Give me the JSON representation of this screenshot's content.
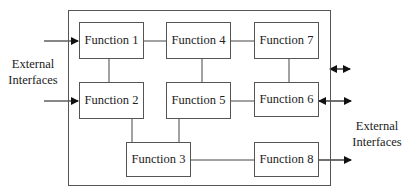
{
  "diagram": {
    "type": "functional-block-diagram",
    "frame_label": "",
    "functions": [
      {
        "id": "f1",
        "label": "Function 1"
      },
      {
        "id": "f2",
        "label": "Function 2"
      },
      {
        "id": "f3",
        "label": "Function 3"
      },
      {
        "id": "f4",
        "label": "Function 4"
      },
      {
        "id": "f5",
        "label": "Function 5"
      },
      {
        "id": "f6",
        "label": "Function 6"
      },
      {
        "id": "f7",
        "label": "Function 7"
      },
      {
        "id": "f8",
        "label": "Function 8"
      }
    ],
    "external_interfaces": {
      "left_label_line1": "External",
      "left_label_line2": "Interfaces",
      "right_label_line1": "External",
      "right_label_line2": "Interfaces"
    },
    "connections": [
      {
        "from": "Function 1",
        "to": "Function 4",
        "style": "line"
      },
      {
        "from": "Function 4",
        "to": "Function 7",
        "style": "line"
      },
      {
        "from": "Function 1",
        "to": "Function 2",
        "style": "line"
      },
      {
        "from": "Function 4",
        "to": "Function 5",
        "style": "line"
      },
      {
        "from": "Function 7",
        "to": "Function 6",
        "style": "line"
      },
      {
        "from": "Function 5",
        "to": "Function 6",
        "style": "line"
      },
      {
        "from": "Function 2",
        "to": "Function 3",
        "style": "line"
      },
      {
        "from": "Function 5",
        "to": "Function 3",
        "style": "line"
      },
      {
        "from": "Function 3",
        "to": "Function 8",
        "style": "line"
      },
      {
        "from": "External Interfaces (left)",
        "to": "Function 1",
        "style": "arrow"
      },
      {
        "from": "External Interfaces (left)",
        "to": "Function 2",
        "style": "arrow"
      },
      {
        "from": "System boundary",
        "to": "External Interfaces (right)",
        "style": "bidirectional-arrow"
      },
      {
        "from": "Function 6",
        "to": "External Interfaces (right)",
        "style": "bidirectional-arrow"
      },
      {
        "from": "Function 8",
        "to": "External Interfaces (right)",
        "style": "arrow"
      }
    ],
    "colors": {
      "line": "#333333",
      "box_border": "#555555",
      "background": "#ffffff",
      "text": "#222222"
    }
  }
}
